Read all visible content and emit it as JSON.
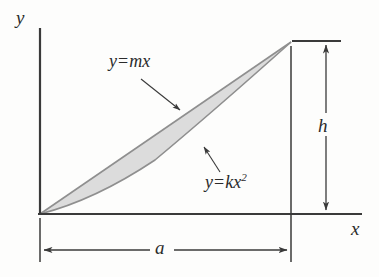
{
  "figure": {
    "background_color": "#fdfdfc",
    "ink_color": "#3a3a3a",
    "shade_fill_color": "#dcdcdc",
    "shade_edge_color": "#9a9a9a",
    "axes": {
      "y_axis_label": "y",
      "x_axis_label": "x",
      "origin_px": [
        40,
        214
      ],
      "x_axis_end_px": [
        362,
        214
      ],
      "y_axis_top_px": [
        40,
        28
      ]
    },
    "curves": [
      {
        "name": "straight-line",
        "label": "y = mx",
        "label_lhs": "y",
        "label_eq": "=",
        "label_rhs": "mx",
        "type": "line",
        "from_px": [
          40,
          214
        ],
        "to_px": [
          291,
          42
        ],
        "leader_from_px": [
          141,
          79
        ],
        "leader_to_px": [
          180,
          110
        ]
      },
      {
        "name": "parabola",
        "label": "y = kx2",
        "label_lhs": "y",
        "label_eq": "=",
        "label_rhs": "kx",
        "label_exponent": "2",
        "type": "quadratic",
        "from_px": [
          40,
          214
        ],
        "to_px": [
          291,
          42
        ],
        "leader_from_px": [
          220,
          172
        ],
        "leader_to_px": [
          204,
          147
        ]
      }
    ],
    "dimensions": [
      {
        "name": "height-dimension",
        "label": "h",
        "orientation": "vertical",
        "value_px": 173,
        "line_x_px": 326,
        "top_y_px": 41,
        "bottom_y_px": 214,
        "extension_line_top_px": [
          292,
          41
        ],
        "extension_line_bottom_px": [
          341,
          41
        ]
      },
      {
        "name": "width-dimension",
        "label": "a",
        "orientation": "horizontal",
        "value_px": 251,
        "line_y_px": 250,
        "left_x_px": 40,
        "right_x_px": 291,
        "extension_left_px": [
          40,
          218,
          40,
          262
        ],
        "extension_right_px": [
          291,
          46,
          291,
          262
        ]
      }
    ]
  }
}
